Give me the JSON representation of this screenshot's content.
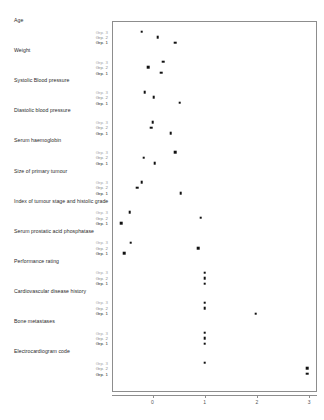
{
  "chart_data": {
    "type": "scatter",
    "title": "",
    "xlabel": "",
    "ylabel": "",
    "xlim": [
      -0.78,
      3.3
    ],
    "xticks": [
      0,
      1,
      2,
      3
    ],
    "xtick_labels": [
      "0",
      "1",
      "2",
      "3"
    ],
    "grid": false,
    "legend_position": "none",
    "group_labels": [
      "Grp. 3",
      "Grp. 2",
      "Grp. 1"
    ],
    "panels": [
      {
        "variable": "Age",
        "points": [
          {
            "group": "Grp. 3",
            "value": -0.21
          },
          {
            "group": "Grp. 2",
            "value": 0.1
          },
          {
            "group": "Grp. 1",
            "value": 0.44
          }
        ]
      },
      {
        "variable": "Weight",
        "points": [
          {
            "group": "Grp. 3",
            "value": 0.21
          },
          {
            "group": "Grp. 2",
            "value": -0.08
          },
          {
            "group": "Grp. 1",
            "value": 0.17
          }
        ]
      },
      {
        "variable": "Systolic Blood pressure",
        "points": [
          {
            "group": "Grp. 3",
            "value": -0.15
          },
          {
            "group": "Grp. 2",
            "value": 0.02
          },
          {
            "group": "Grp. 1",
            "value": 0.52
          }
        ]
      },
      {
        "variable": "Diastolic blood pressure",
        "points": [
          {
            "group": "Grp. 3",
            "value": 0.0
          },
          {
            "group": "Grp. 2",
            "value": -0.02
          },
          {
            "group": "Grp. 1",
            "value": 0.35
          }
        ]
      },
      {
        "variable": "Serum haemoglobin",
        "points": [
          {
            "group": "Grp. 3",
            "value": 0.44
          },
          {
            "group": "Grp. 2",
            "value": -0.17
          },
          {
            "group": "Grp. 1",
            "value": 0.04
          }
        ]
      },
      {
        "variable": "Size of primary tumour",
        "points": [
          {
            "group": "Grp. 3",
            "value": -0.21
          },
          {
            "group": "Grp. 2",
            "value": -0.29
          },
          {
            "group": "Grp. 1",
            "value": 0.54
          }
        ]
      },
      {
        "variable": "Index of tumour stage and histolic grade",
        "points": [
          {
            "group": "Grp. 3",
            "value": -0.44
          },
          {
            "group": "Grp. 2",
            "value": 0.92
          },
          {
            "group": "Grp. 1",
            "value": -0.6
          }
        ]
      },
      {
        "variable": "Serum prostatic acid phosphatase",
        "points": [
          {
            "group": "Grp. 3",
            "value": -0.42
          },
          {
            "group": "Grp. 2",
            "value": 0.88
          },
          {
            "group": "Grp. 1",
            "value": -0.54
          }
        ]
      },
      {
        "variable": "Performance rating",
        "points": [
          {
            "group": "Grp. 3",
            "value": 1.0
          },
          {
            "group": "Grp. 2",
            "value": 1.0
          },
          {
            "group": "Grp. 1",
            "value": 1.0
          }
        ]
      },
      {
        "variable": "Cardiovascular disease history",
        "points": [
          {
            "group": "Grp. 3",
            "value": 1.0
          },
          {
            "group": "Grp. 2",
            "value": 1.0
          },
          {
            "group": "Grp. 1",
            "value": 1.98
          }
        ]
      },
      {
        "variable": "Bone metastases",
        "points": [
          {
            "group": "Grp. 3",
            "value": 1.0
          },
          {
            "group": "Grp. 2",
            "value": 1.0
          },
          {
            "group": "Grp. 1",
            "value": 1.0
          }
        ]
      },
      {
        "variable": "Electrocardiogram code",
        "points": [
          {
            "group": "Grp. 3",
            "value": 1.0
          },
          {
            "group": "Grp. 2",
            "value": 2.96
          },
          {
            "group": "Grp. 1",
            "value": 2.96
          }
        ]
      }
    ]
  }
}
